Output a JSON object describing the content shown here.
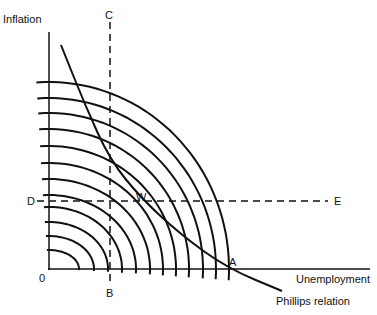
{
  "diagram": {
    "axes": {
      "y_label": "Inflation",
      "x_label": "Unemployment",
      "origin_label": "0"
    },
    "points": {
      "A": "A",
      "B": "B",
      "C": "C",
      "D": "D",
      "E": "E",
      "W": "W"
    },
    "curve_label": "Phillips relation",
    "colors": {
      "ink": "#111111",
      "background": "#ffffff"
    },
    "geometry": {
      "origin": [
        49,
        269
      ],
      "x_axis_end": 370,
      "y_axis_top": 32,
      "dashed_vertical_x": 110,
      "dashed_horizontal_y": 201,
      "arc_radii_y": [
        187,
        171,
        156,
        140,
        123,
        106,
        90,
        74,
        62,
        47,
        33,
        19
      ],
      "arc_radii_x": [
        180,
        167,
        154,
        140,
        127,
        114,
        101,
        87,
        73,
        59,
        45,
        30
      ],
      "phillips_points": [
        [
          61,
          45
        ],
        [
          85,
          105
        ],
        [
          110,
          160
        ],
        [
          141,
          198
        ],
        [
          180,
          234
        ],
        [
          227,
          268
        ],
        [
          282,
          291
        ]
      ]
    }
  }
}
